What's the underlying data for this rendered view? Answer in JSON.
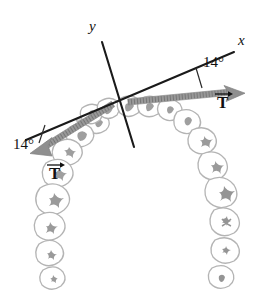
{
  "figure": {
    "background_color": "#ffffff"
  },
  "colors": {
    "axis": "#1a1a1a",
    "text": "#111111",
    "arrow": "#8c8c8c",
    "arrow_dark": "#7a7a7a",
    "tooth_outline": "#b4b4b4",
    "tooth_detail": "#9a9a9a",
    "wire": "#9c9c9c"
  },
  "axes": {
    "x_label": "x",
    "y_label": "y",
    "origin": {
      "x": 117,
      "y": 97
    },
    "x_start": {
      "x": 26,
      "y": 140
    },
    "x_end": {
      "x": 234,
      "y": 52
    },
    "y_start": {
      "x": 102,
      "y": 42
    },
    "y_end": {
      "x": 134,
      "y": 147
    },
    "x_label_pos": {
      "x": 238,
      "y": 40
    },
    "y_label_pos": {
      "x": 90,
      "y": 26
    }
  },
  "annotations": {
    "angle_right": {
      "label": "14°",
      "value": 14,
      "unit": "degrees",
      "pos": {
        "x": 198,
        "y": 63
      }
    },
    "angle_left": {
      "label": "14°",
      "value": 14,
      "unit": "degrees",
      "pos": {
        "x": 14,
        "y": 143
      }
    },
    "vector_right": {
      "label": "T",
      "accent": "arrow-right",
      "pos": {
        "x": 214,
        "y": 93
      },
      "tail": {
        "x": 128,
        "y": 102
      },
      "tip": {
        "x": 243,
        "y": 83
      }
    },
    "vector_left": {
      "label": "T",
      "accent": "arrow-right",
      "pos": {
        "x": 46,
        "y": 164
      },
      "tail": {
        "x": 113,
        "y": 104
      },
      "tip": {
        "x": 37,
        "y": 152
      }
    }
  }
}
